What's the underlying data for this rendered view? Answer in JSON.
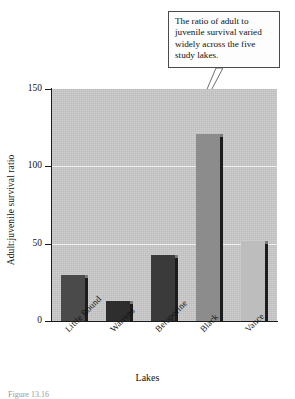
{
  "chart_data": {
    "type": "bar",
    "title": "",
    "categories": [
      "Little Round",
      "Warrens",
      "Beloporine",
      "Black",
      "Vance"
    ],
    "values": [
      30,
      13,
      43,
      121,
      52
    ],
    "xlabel": "Lakes",
    "ylabel": "Adult:juvenile survival ratio",
    "ylim": [
      0,
      150
    ],
    "yticks": [
      0,
      50,
      100,
      150
    ],
    "grid": "horizontal-white",
    "legend": "none",
    "bar_colors": [
      "#4a4a4a",
      "#2e2e2e",
      "#3a3a3a",
      "#8c8c8c",
      "#bdbdbd"
    ],
    "plot_background": "#c9c9c9",
    "annotations": [
      {
        "text": "The ratio of adult to juvenile survival varied widely across the five study lakes.",
        "points_to": "Black"
      }
    ]
  },
  "annotation": {
    "line1": "The ratio of adult to",
    "line2": "juvenile survival varied",
    "line3": "widely across the five",
    "line4": "study lakes."
  },
  "axis": {
    "y_title": "Adult:juvenile survival ratio",
    "x_title": "Lakes",
    "y_tick_0": "0",
    "y_tick_1": "50",
    "y_tick_2": "100",
    "y_tick_3": "150"
  },
  "caption": {
    "text": "Figure 13.16"
  }
}
